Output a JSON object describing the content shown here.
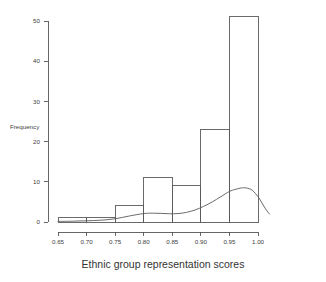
{
  "chart_data": {
    "type": "bar",
    "title": "",
    "subtitle": "",
    "xlabel": "Ethnic group representation scores",
    "ylabel": "Frequency",
    "grid": false,
    "legend": null,
    "xlim": [
      0.65,
      1.02
    ],
    "ylim": [
      0,
      51
    ],
    "x_ticks": [
      0.65,
      0.7,
      0.75,
      0.8,
      0.85,
      0.9,
      0.95,
      1.0
    ],
    "x_tick_labels": [
      "0.65",
      "0.70",
      "0.75",
      "0.80",
      "0.85",
      "0.90",
      "0.95",
      "1.00"
    ],
    "y_ticks": [
      0,
      10,
      20,
      30,
      40,
      50
    ],
    "y_tick_labels": [
      "0",
      "10",
      "20",
      "30",
      "40",
      "50"
    ],
    "bin_width": 0.05,
    "bin_edges": [
      0.65,
      0.7,
      0.75,
      0.8,
      0.85,
      0.9,
      0.95,
      1.0
    ],
    "categories": [
      "0.65-0.70",
      "0.70-0.75",
      "0.75-0.80",
      "0.80-0.85",
      "0.85-0.90",
      "0.90-0.95",
      "0.95-1.00"
    ],
    "values": [
      1,
      1,
      4,
      11,
      9,
      23,
      51
    ],
    "overlay": {
      "name": "density curve",
      "type": "line",
      "x": [
        0.65,
        0.675,
        0.7,
        0.725,
        0.75,
        0.775,
        0.8,
        0.815,
        0.83,
        0.845,
        0.86,
        0.875,
        0.89,
        0.905,
        0.92,
        0.935,
        0.95,
        0.96,
        0.97,
        0.975,
        0.98,
        0.99,
        1.0,
        1.005,
        1.01,
        1.015,
        1.02
      ],
      "y": [
        0.15,
        0.2,
        0.3,
        0.45,
        0.8,
        1.5,
        2.1,
        2.2,
        2.15,
        2.05,
        2.1,
        2.4,
        3.0,
        3.9,
        5.0,
        6.3,
        7.6,
        8.1,
        8.45,
        8.5,
        8.45,
        7.9,
        6.3,
        5.2,
        4.0,
        2.9,
        2.0
      ]
    }
  },
  "colors": {
    "background": "#ffffff",
    "axis": "#555555",
    "bar_stroke": "#5a5a5a",
    "curve": "#5a5a5a",
    "text": "#3d3d3d"
  }
}
